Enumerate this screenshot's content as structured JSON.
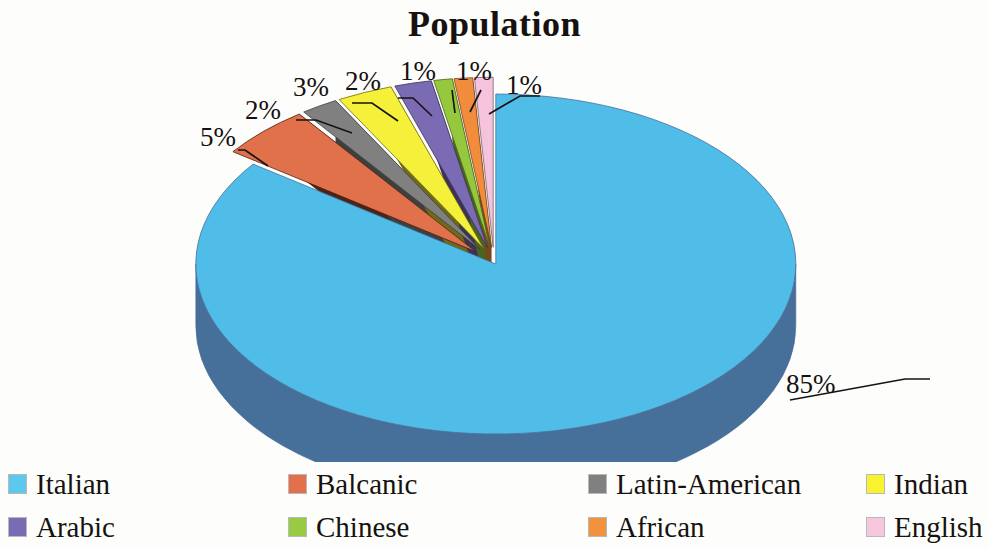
{
  "chart_data": {
    "type": "pie",
    "title": "Population",
    "xlabel": "",
    "ylabel": "",
    "exploded": true,
    "three_d": true,
    "legend_position": "bottom",
    "grid": false,
    "categories": [
      "Italian",
      "Balcanic",
      "Latin-American",
      "Indian",
      "Arabic",
      "Chinese",
      "African",
      "English"
    ],
    "values": [
      85,
      5,
      2,
      3,
      2,
      1,
      1,
      1
    ],
    "value_labels": [
      "85%",
      "5%",
      "2%",
      "3%",
      "2%",
      "1%",
      "1%",
      "1%"
    ],
    "colors": [
      "#50bce8",
      "#e0714a",
      "#808080",
      "#f5f03a",
      "#7b6bb5",
      "#95c83c",
      "#f08c3c",
      "#f5c4dc"
    ],
    "side_colors": [
      "#466f99",
      "#4a2418",
      "#3f3f3f",
      "#6e6a18",
      "#3b3258",
      "#4a641e",
      "#7a461e",
      "#7a6270"
    ],
    "slices": [
      {
        "label": "Italian",
        "value": 85,
        "value_label": "85%",
        "color": "#50bce8",
        "side_color": "#466f99"
      },
      {
        "label": "Balcanic",
        "value": 5,
        "value_label": "5%",
        "color": "#e0714a",
        "side_color": "#4a2418"
      },
      {
        "label": "Latin-American",
        "value": 2,
        "value_label": "2%",
        "color": "#808080",
        "side_color": "#3f3f3f"
      },
      {
        "label": "Indian",
        "value": 3,
        "value_label": "3%",
        "color": "#f5f03a",
        "side_color": "#6e6a18"
      },
      {
        "label": "Arabic",
        "value": 2,
        "value_label": "2%",
        "color": "#7b6bb5",
        "side_color": "#3b3258"
      },
      {
        "label": "Chinese",
        "value": 1,
        "value_label": "1%",
        "color": "#95c83c",
        "side_color": "#4a641e"
      },
      {
        "label": "African",
        "value": 1,
        "value_label": "1%",
        "color": "#f08c3c",
        "side_color": "#7a461e"
      },
      {
        "label": "English",
        "value": 1,
        "value_label": "1%",
        "color": "#f5c4dc",
        "side_color": "#7a6270"
      }
    ]
  },
  "title": {
    "text": "Population"
  },
  "callouts": [
    {
      "name": "callout-italian",
      "text": "85%",
      "left": 786,
      "top": 371
    },
    {
      "name": "callout-balcanic",
      "text": "5%",
      "left": 200,
      "top": 124
    },
    {
      "name": "callout-latin-american",
      "text": "2%",
      "left": 245,
      "top": 97
    },
    {
      "name": "callout-indian",
      "text": "3%",
      "left": 293,
      "top": 74
    },
    {
      "name": "callout-arabic",
      "text": "2%",
      "left": 345,
      "top": 68
    },
    {
      "name": "callout-chinese",
      "text": "1%",
      "left": 400,
      "top": 58
    },
    {
      "name": "callout-african",
      "text": "1%",
      "left": 456,
      "top": 58
    },
    {
      "name": "callout-english",
      "text": "1%",
      "left": 506,
      "top": 72
    }
  ],
  "legend": {
    "rows": [
      [
        {
          "label": "Italian",
          "color": "#5bc8ec"
        },
        {
          "label": "Balcanic",
          "color": "#e2704c"
        },
        {
          "label": "Latin-American",
          "color": "#808080"
        },
        {
          "label": "Indian",
          "color": "#f7f331"
        }
      ],
      [
        {
          "label": "Arabic",
          "color": "#7b6bb5"
        },
        {
          "label": "Chinese",
          "color": "#98ca43"
        },
        {
          "label": "African",
          "color": "#f2913e"
        },
        {
          "label": "English",
          "color": "#f6c7de"
        }
      ]
    ]
  }
}
